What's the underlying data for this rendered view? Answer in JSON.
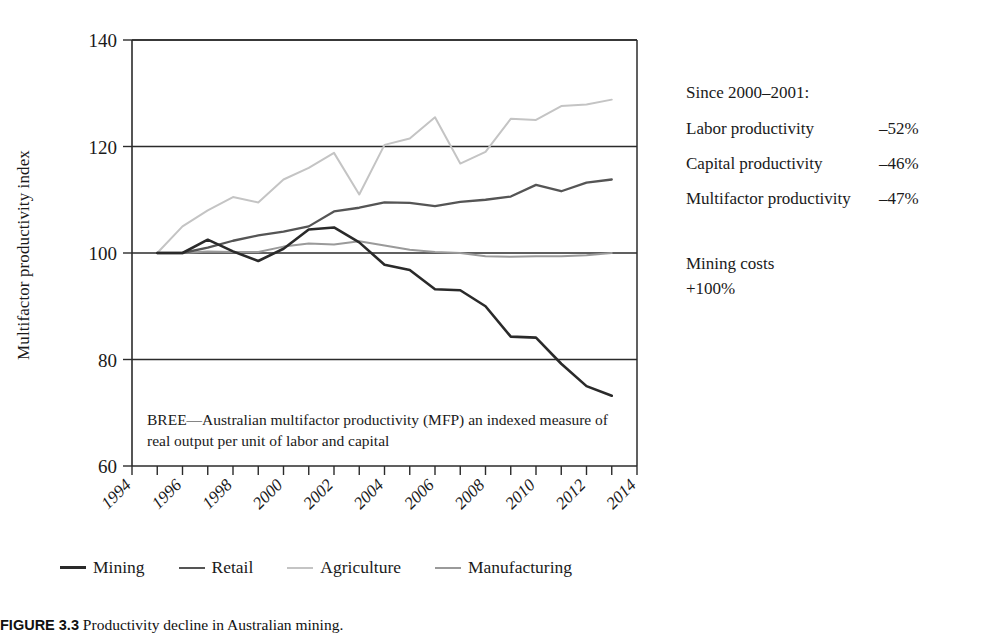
{
  "axes": {
    "y_title": "Multifactor productivity index",
    "y_ticks": [
      60,
      80,
      100,
      120,
      140
    ],
    "x_ticks": [
      1994,
      1996,
      1998,
      2000,
      2002,
      2004,
      2006,
      2008,
      2010,
      2012,
      2014
    ]
  },
  "plot_note": "BREE—Australian multifactor productivity (MFP) an indexed measure of real output per unit of labor and capital",
  "legend": {
    "items": [
      {
        "label": "Mining",
        "color": "#2a2a2a",
        "width": 2.6
      },
      {
        "label": "Retail",
        "color": "#555555",
        "width": 2.3
      },
      {
        "label": "Agriculture",
        "color": "#c4c4c4",
        "width": 2.0
      },
      {
        "label": "Manufacturing",
        "color": "#9a9a9a",
        "width": 2.0
      }
    ]
  },
  "side_panel": {
    "heading": "Since 2000–2001:",
    "stats": [
      {
        "label": "Labor productivity",
        "value": "–52%"
      },
      {
        "label": "Capital productivity",
        "value": "–46%"
      },
      {
        "label": "Multifactor productivity",
        "value": "–47%"
      }
    ],
    "cost_label": "Mining costs",
    "cost_value": "+100%"
  },
  "caption": {
    "number": "FIGURE 3.3",
    "text": "Productivity decline in Australian mining."
  },
  "chart_data": {
    "type": "line",
    "title": "",
    "xlabel": "",
    "ylabel": "Multifactor productivity index",
    "xlim": [
      1994,
      2014
    ],
    "ylim": [
      60,
      140
    ],
    "grid": true,
    "legend_position": "bottom",
    "x": [
      1995,
      1996,
      1997,
      1998,
      1999,
      2000,
      2001,
      2002,
      2003,
      2004,
      2005,
      2006,
      2007,
      2008,
      2009,
      2010,
      2011,
      2012,
      2013
    ],
    "series": [
      {
        "name": "Mining",
        "color": "#2a2a2a",
        "values": [
          100,
          100,
          102.5,
          100.3,
          98.5,
          100.8,
          104.4,
          104.8,
          102.0,
          97.8,
          96.8,
          93.2,
          93.0,
          90.0,
          84.3,
          84.1,
          79.2,
          75.0,
          73.2
        ]
      },
      {
        "name": "Retail",
        "color": "#555555",
        "values": [
          100,
          100,
          101.0,
          102.3,
          103.3,
          104.0,
          105.0,
          107.8,
          108.5,
          109.5,
          109.4,
          108.8,
          109.6,
          110.0,
          110.6,
          112.8,
          111.6,
          113.2,
          113.8
        ]
      },
      {
        "name": "Agriculture",
        "color": "#c4c4c4",
        "values": [
          100,
          105.0,
          108.0,
          110.5,
          109.5,
          113.8,
          116.0,
          118.8,
          111.0,
          120.3,
          121.5,
          125.5,
          116.8,
          119.0,
          125.2,
          125.0,
          127.6,
          127.9,
          128.8
        ]
      },
      {
        "name": "Manufacturing",
        "color": "#9a9a9a",
        "values": [
          100,
          100,
          100.3,
          100.2,
          100.2,
          101.2,
          101.8,
          101.6,
          102.2,
          101.4,
          100.6,
          100.2,
          100.0,
          99.4,
          99.3,
          99.4,
          99.4,
          99.6,
          100.0
        ]
      }
    ]
  }
}
